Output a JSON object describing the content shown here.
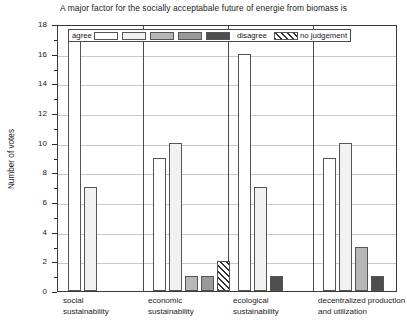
{
  "chart_data": {
    "type": "bar",
    "title": "A major factor for the socially acceptabale future of energie from biomass is",
    "xlabel": "",
    "ylabel": "Number of votes",
    "ylim": [
      0,
      18
    ],
    "y_major_step": 2,
    "y_minor_step": 1,
    "grid": true,
    "legend_position": "top-inside",
    "categories": [
      "social\nsustainability",
      "economic\nsustainability",
      "ecological\nsustainability",
      "decentralized production\nand utilization"
    ],
    "category_lines": [
      [
        "social",
        "sustainability"
      ],
      [
        "economic",
        "sustainability"
      ],
      [
        "ecological",
        "sustainability"
      ],
      [
        "decentralized production",
        "and utilization"
      ]
    ],
    "y_tick_labels": [
      "0",
      "2",
      "4",
      "6",
      "8",
      "10",
      "12",
      "14",
      "16",
      "18"
    ],
    "legend": {
      "left_label": "agree",
      "right_label": "disagree",
      "extra_label": "no judgement",
      "swatches": [
        "scale-1",
        "scale-2",
        "scale-3",
        "scale-4",
        "scale-5"
      ],
      "extra_swatch": "hatched"
    },
    "series": [
      {
        "name": "scale-1",
        "swatch": "sw0",
        "values": [
          17,
          9,
          16,
          9
        ]
      },
      {
        "name": "scale-2",
        "swatch": "sw1",
        "values": [
          7,
          10,
          7,
          10
        ]
      },
      {
        "name": "scale-3",
        "swatch": "sw2",
        "values": [
          0,
          1,
          0,
          3
        ]
      },
      {
        "name": "scale-4",
        "swatch": "sw3",
        "values": [
          0,
          1,
          0,
          0
        ]
      },
      {
        "name": "scale-5",
        "swatch": "sw4",
        "values": [
          0,
          0,
          1,
          1
        ]
      },
      {
        "name": "no judgement",
        "swatch": "swh",
        "values": [
          0,
          2,
          0,
          0
        ]
      }
    ],
    "bars": [
      {
        "group": 0,
        "series": "scale-1",
        "swatch": "sw0",
        "value": 17
      },
      {
        "group": 0,
        "series": "scale-2",
        "swatch": "sw1",
        "value": 7
      },
      {
        "group": 1,
        "series": "scale-1",
        "swatch": "sw0",
        "value": 9
      },
      {
        "group": 1,
        "series": "scale-2",
        "swatch": "sw1",
        "value": 10
      },
      {
        "group": 1,
        "series": "scale-3",
        "swatch": "sw2",
        "value": 1
      },
      {
        "group": 1,
        "series": "scale-4",
        "swatch": "sw3",
        "value": 1
      },
      {
        "group": 1,
        "series": "no judgement",
        "swatch": "swh",
        "value": 2
      },
      {
        "group": 2,
        "series": "scale-1",
        "swatch": "sw0",
        "value": 16
      },
      {
        "group": 2,
        "series": "scale-2",
        "swatch": "sw1",
        "value": 7
      },
      {
        "group": 2,
        "series": "scale-5",
        "swatch": "sw4",
        "value": 1
      },
      {
        "group": 3,
        "series": "scale-1",
        "swatch": "sw0",
        "value": 9
      },
      {
        "group": 3,
        "series": "scale-2",
        "swatch": "sw1",
        "value": 10
      },
      {
        "group": 3,
        "series": "scale-3",
        "swatch": "sw2",
        "value": 3
      },
      {
        "group": 3,
        "series": "scale-5",
        "swatch": "sw4",
        "value": 1
      }
    ],
    "colors": {
      "scale-1": "#ffffff",
      "scale-2": "#f1f1f1",
      "scale-3": "#b7b7b7",
      "scale-4": "#9a9a9a",
      "scale-5": "#4e4e4e",
      "grid": "#c9c9c9",
      "axis": "#3a3a3a",
      "text": "#1a1a1a"
    }
  }
}
